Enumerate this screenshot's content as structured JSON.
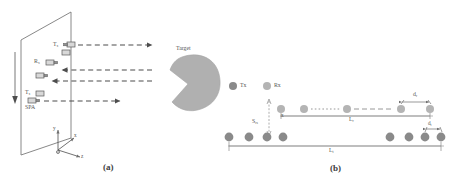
{
  "figure": {
    "type": "schematic-diagram",
    "panels": [
      {
        "id": "a",
        "caption": "(a)",
        "description": "Sparse planar array illuminating a target",
        "plane_label": "SPA",
        "target_label": "Target",
        "elements": [
          {
            "label": "Tx",
            "subscript": "1",
            "role": "transmitter",
            "ray": "outgoing"
          },
          {
            "label": "Rx",
            "subscript": "1",
            "role": "receiver",
            "ray": "incoming"
          },
          {
            "label": "Rx",
            "subscript": "2",
            "role": "receiver",
            "ray": "incoming"
          },
          {
            "label": "Tx",
            "subscript": "2",
            "role": "transmitter",
            "ray": "outgoing"
          }
        ],
        "axes": {
          "x": "x",
          "y": "y",
          "z": "z",
          "origin": "O"
        }
      },
      {
        "id": "b",
        "caption": "(b)",
        "description": "Array element geometry: Rx sub-array above Tx array",
        "legend": [
          {
            "label": "Tx",
            "color": "#8a8a8a"
          },
          {
            "label": "Rx",
            "color": "#b4b4b4"
          }
        ],
        "dimensions": [
          {
            "label": "d",
            "subscript": "r",
            "meaning": "Rx element spacing"
          },
          {
            "label": "L",
            "subscript": "r",
            "meaning": "Rx array length"
          },
          {
            "label": "d",
            "subscript": "t",
            "meaning": "Tx element spacing"
          },
          {
            "label": "L",
            "subscript": "t",
            "meaning": "Tx array length"
          },
          {
            "label": "S",
            "subscript": "rs",
            "meaning": "Rx to Tx array offset"
          }
        ],
        "rx_row": {
          "count": 5,
          "ellipsis_between": [
            2,
            3
          ]
        },
        "tx_row": {
          "left_count": 4,
          "right_count": 4,
          "ellipsis": true
        }
      }
    ]
  },
  "colors": {
    "tx_dot": "#8a8a8a",
    "rx_dot": "#b4b4b4",
    "target_fill": "#b0b0b0",
    "line": "#6e6e6e",
    "dash": "#555555"
  },
  "labels": {
    "tx1": "T",
    "tx1_sub": "x",
    "rx": "R",
    "rx_sub": "x",
    "spa": "SPA",
    "target": "Target",
    "legend_tx": "Tx",
    "legend_rx": "Rx",
    "dr": "d",
    "dr_sub": "r",
    "lr": "L",
    "lr_sub": "r",
    "dt": "d",
    "dt_sub": "t",
    "lt": "L",
    "lt_sub": "t",
    "srs": "S",
    "srs_sub": "rs",
    "cap_a": "(a)",
    "cap_b": "(b)",
    "ax_x": "x",
    "ax_y": "y",
    "ax_z": "z",
    "ax_o": "O"
  }
}
